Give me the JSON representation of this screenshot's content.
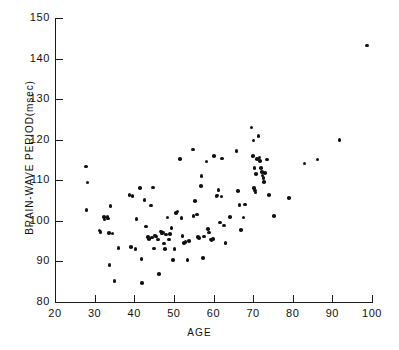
{
  "chart_data": {
    "type": "scatter",
    "title": "",
    "xlabel": "AGE",
    "ylabel": "BRAIN-WAVE PERIOD(msec)",
    "xlim": [
      20,
      100
    ],
    "ylim": [
      80,
      150
    ],
    "xticks": [
      20,
      30,
      40,
      50,
      60,
      70,
      80,
      90,
      100
    ],
    "yticks": [
      80,
      90,
      100,
      110,
      120,
      130,
      140,
      150
    ],
    "xtick_labels": [
      "20",
      "30",
      "40",
      "50",
      "60",
      "70",
      "80",
      "90",
      "100"
    ],
    "ytick_labels": [
      "80",
      "90",
      "100",
      "110",
      "120",
      "130",
      "140",
      "150"
    ],
    "grid": false,
    "legend": null,
    "marker": "filled-circle",
    "marker_color": "#111111",
    "n_points": 113,
    "points": [
      [
        27.8,
        113.4
      ],
      [
        28.2,
        109.5
      ],
      [
        28.0,
        102.7
      ],
      [
        31.2,
        97.6
      ],
      [
        31.5,
        97.2
      ],
      [
        32.3,
        100.9
      ],
      [
        32.5,
        100.3
      ],
      [
        33.2,
        101.0
      ],
      [
        33.4,
        100.6
      ],
      [
        33.6,
        97.0
      ],
      [
        34.0,
        103.7
      ],
      [
        33.8,
        89.1
      ],
      [
        35.0,
        85.2
      ],
      [
        38.8,
        106.4
      ],
      [
        39.6,
        106.1
      ],
      [
        39.2,
        93.6
      ],
      [
        40.3,
        93.1
      ],
      [
        40.6,
        100.5
      ],
      [
        41.5,
        108.1
      ],
      [
        41.8,
        90.6
      ],
      [
        42.0,
        84.7
      ],
      [
        42.6,
        105.2
      ],
      [
        43.0,
        98.6
      ],
      [
        43.5,
        96.0
      ],
      [
        43.7,
        95.6
      ],
      [
        44.2,
        103.8
      ],
      [
        44.5,
        95.9
      ],
      [
        44.8,
        108.2
      ],
      [
        45.0,
        93.2
      ],
      [
        45.5,
        96.1
      ],
      [
        46.0,
        95.4
      ],
      [
        46.3,
        86.9
      ],
      [
        46.8,
        97.4
      ],
      [
        47.0,
        96.9
      ],
      [
        47.2,
        97.1
      ],
      [
        47.5,
        94.4
      ],
      [
        47.8,
        93.0
      ],
      [
        48.4,
        100.8
      ],
      [
        48.8,
        95.4
      ],
      [
        49.4,
        98.2
      ],
      [
        49.8,
        90.4
      ],
      [
        50.2,
        93.1
      ],
      [
        50.6,
        101.9
      ],
      [
        50.9,
        102.3
      ],
      [
        51.6,
        115.3
      ],
      [
        51.9,
        100.7
      ],
      [
        52.2,
        96.2
      ],
      [
        52.6,
        94.6
      ],
      [
        52.9,
        94.8
      ],
      [
        53.4,
        90.4
      ],
      [
        54.8,
        117.6
      ],
      [
        55.3,
        104.9
      ],
      [
        55.8,
        101.6
      ],
      [
        56.1,
        96.0
      ],
      [
        56.4,
        95.8
      ],
      [
        56.8,
        108.6
      ],
      [
        57.0,
        111.0
      ],
      [
        57.3,
        90.9
      ],
      [
        58.2,
        114.6
      ],
      [
        58.6,
        98.0
      ],
      [
        58.9,
        97.1
      ],
      [
        59.2,
        95.4
      ],
      [
        59.5,
        95.3
      ],
      [
        60.2,
        116.0
      ],
      [
        60.8,
        106.1
      ],
      [
        61.0,
        106.2
      ],
      [
        61.3,
        107.6
      ],
      [
        61.7,
        99.6
      ],
      [
        62.2,
        115.4
      ],
      [
        62.6,
        98.9
      ],
      [
        63.0,
        94.6
      ],
      [
        65.8,
        117.2
      ],
      [
        66.2,
        107.3
      ],
      [
        66.6,
        103.9
      ],
      [
        66.9,
        97.7
      ],
      [
        67.6,
        100.8
      ],
      [
        69.6,
        123.0
      ],
      [
        70.1,
        119.8
      ],
      [
        70.3,
        113.0
      ],
      [
        70.0,
        116.0
      ],
      [
        70.4,
        107.5
      ],
      [
        70.6,
        107.0
      ],
      [
        70.2,
        108.1
      ],
      [
        71.4,
        120.9
      ],
      [
        71.0,
        115.2
      ],
      [
        71.6,
        115.6
      ],
      [
        71.8,
        114.8
      ],
      [
        72.2,
        112.0
      ],
      [
        72.4,
        111.2
      ],
      [
        72.6,
        110.6
      ],
      [
        72.0,
        113.1
      ],
      [
        72.8,
        109.6
      ],
      [
        73.5,
        115.1
      ],
      [
        74.0,
        106.4
      ],
      [
        75.2,
        101.2
      ],
      [
        79.0,
        105.6
      ],
      [
        83.0,
        114.1
      ],
      [
        86.2,
        115.1
      ],
      [
        91.8,
        119.9
      ],
      [
        98.8,
        143.2
      ],
      [
        34.5,
        96.9
      ],
      [
        36.0,
        93.3
      ],
      [
        45.2,
        96.4
      ],
      [
        48.0,
        96.6
      ],
      [
        53.8,
        95.0
      ],
      [
        57.6,
        96.1
      ],
      [
        59.8,
        95.6
      ],
      [
        62.0,
        106.0
      ],
      [
        64.2,
        100.9
      ],
      [
        68.0,
        104.0
      ],
      [
        70.8,
        111.6
      ],
      [
        73.0,
        111.8
      ],
      [
        49.0,
        96.8
      ],
      [
        55.0,
        101.2
      ]
    ]
  }
}
